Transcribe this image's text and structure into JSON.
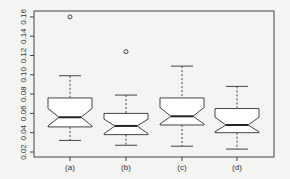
{
  "chart_data": {
    "type": "boxplot",
    "notched": true,
    "title": "",
    "xlabel": "",
    "ylabel": "",
    "categories": [
      "(a)",
      "(b)",
      "(c)",
      "(d)"
    ],
    "ylim": [
      0.02,
      0.16
    ],
    "yticks": [
      0.02,
      0.04,
      0.06,
      0.08,
      0.1,
      0.12,
      0.14,
      0.16
    ],
    "ytick_labels": [
      "0.02",
      "0.04",
      "0.06",
      "0.08",
      "0.10",
      "0.12",
      "0.14",
      "0.16"
    ],
    "grid": false,
    "legend": null,
    "series": [
      {
        "name": "(a)",
        "whisker_low": 0.032,
        "q1": 0.046,
        "median": 0.056,
        "q3": 0.076,
        "whisker_high": 0.099,
        "notch_low": 0.047,
        "notch_high": 0.065,
        "outliers": [
          0.16
        ]
      },
      {
        "name": "(b)",
        "whisker_low": 0.027,
        "q1": 0.038,
        "median": 0.047,
        "q3": 0.06,
        "whisker_high": 0.079,
        "notch_low": 0.039,
        "notch_high": 0.054,
        "outliers": [
          0.124
        ]
      },
      {
        "name": "(c)",
        "whisker_low": 0.026,
        "q1": 0.048,
        "median": 0.057,
        "q3": 0.076,
        "whisker_high": 0.109,
        "notch_low": 0.049,
        "notch_high": 0.066,
        "outliers": []
      },
      {
        "name": "(d)",
        "whisker_low": 0.023,
        "q1": 0.04,
        "median": 0.048,
        "q3": 0.065,
        "whisker_high": 0.088,
        "notch_low": 0.041,
        "notch_high": 0.056,
        "outliers": []
      }
    ]
  },
  "style": {
    "line_color": "#444444",
    "median_color": "#222222",
    "box_fill": "#ffffff",
    "background": "#f4f4f2"
  }
}
